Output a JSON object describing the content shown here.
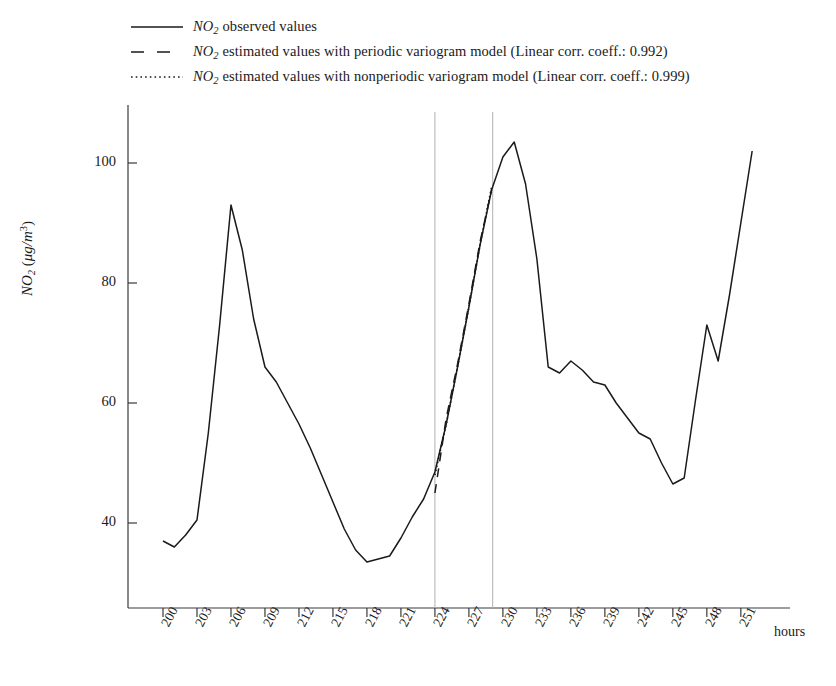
{
  "figure": {
    "background": "#ffffff",
    "line_color": "#1a1a1a",
    "marker_line_color": "#b0b0b0"
  },
  "legend": {
    "entries": [
      {
        "style": "solid",
        "prefix": "NO",
        "subscript": "2",
        "text": " observed values"
      },
      {
        "style": "dashed",
        "prefix": "NO",
        "subscript": "2",
        "text": " estimated values with periodic variogram model (Linear corr. coeff.: 0.992)"
      },
      {
        "style": "dotted",
        "prefix": "NO",
        "subscript": "2",
        "text": " estimated values with nonperiodic variogram model (Linear corr. coeff.: 0.999)"
      }
    ]
  },
  "axes": {
    "ylabel_prefix": "NO",
    "ylabel_sub": "2",
    "ylabel_unit_open": " (",
    "ylabel_unit": "μg/m",
    "ylabel_unit_sup": "3",
    "ylabel_unit_close": ")",
    "xunit": "hours",
    "yticks": [
      "40",
      "60",
      "80",
      "100"
    ],
    "ytick_values": [
      40,
      60,
      80,
      100
    ],
    "xticks": [
      "200",
      "203",
      "206",
      "209",
      "212",
      "215",
      "218",
      "221",
      "224",
      "227",
      "230",
      "233",
      "236",
      "239",
      "242",
      "245",
      "248",
      "251"
    ],
    "xtick_values": [
      200,
      203,
      206,
      209,
      212,
      215,
      218,
      221,
      224,
      227,
      230,
      233,
      236,
      239,
      242,
      245,
      248,
      251
    ],
    "xlim": [
      199,
      254
    ],
    "ylim": [
      30,
      108
    ],
    "grid": false
  },
  "chart_data": {
    "type": "line",
    "title": "",
    "xlabel": "hours",
    "ylabel": "NO2 (μg/m3)",
    "xlim": [
      199,
      254
    ],
    "ylim": [
      30,
      108
    ],
    "grid": false,
    "legend_position": "top-left",
    "annotations": [
      {
        "type": "vline",
        "x": 224.0,
        "color": "#b0b0b0",
        "label": "estimation window start"
      },
      {
        "type": "vline",
        "x": 229.1,
        "color": "#b0b0b0",
        "label": "estimation window end"
      }
    ],
    "series": [
      {
        "name": "NO2 observed values",
        "style": "solid",
        "x": [
          200,
          201,
          202,
          203,
          204,
          205,
          206,
          207,
          208,
          209,
          210,
          211,
          212,
          213,
          214,
          215,
          216,
          217,
          218,
          219,
          220,
          221,
          222,
          223,
          224,
          225,
          226,
          227,
          228,
          229,
          230,
          231,
          232,
          233,
          234,
          235,
          236,
          237,
          238,
          239,
          240,
          241,
          242,
          243,
          244,
          245,
          246,
          247,
          248,
          249,
          250,
          251,
          252
        ],
        "y": [
          37.0,
          36.0,
          38.0,
          40.5,
          55.0,
          73.0,
          93.0,
          85.5,
          74.0,
          66.0,
          63.5,
          60.0,
          56.5,
          52.5,
          48.0,
          43.5,
          39.0,
          35.5,
          33.5,
          34.0,
          34.5,
          37.5,
          41.0,
          44.0,
          48.5,
          56.5,
          66.0,
          76.0,
          86.5,
          95.5,
          101.0,
          103.5,
          96.5,
          84.0,
          66.0,
          65.0,
          67.0,
          65.5,
          63.5,
          63.0,
          60.0,
          57.5,
          55.0,
          54.0,
          50.0,
          46.5,
          47.5,
          60.5,
          73.0,
          67.0,
          78.0,
          90.0,
          102.0
        ]
      },
      {
        "name": "NO2 estimated values with periodic variogram model",
        "style": "dashed",
        "linear_corr_coeff": 0.992,
        "x": [
          224,
          225,
          226,
          227,
          228,
          229
        ],
        "y": [
          45.0,
          57.5,
          66.5,
          76.5,
          87.0,
          95.5
        ]
      },
      {
        "name": "NO2 estimated values with nonperiodic variogram model",
        "style": "dotted",
        "linear_corr_coeff": 0.999,
        "x": [
          224,
          225,
          226,
          227,
          228,
          229
        ],
        "y": [
          48.0,
          56.5,
          66.0,
          76.0,
          86.5,
          96.0
        ]
      }
    ]
  }
}
